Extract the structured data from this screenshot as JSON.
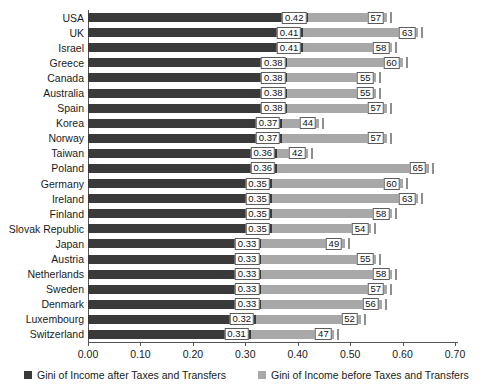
{
  "chart_data": {
    "type": "bar",
    "orientation": "horizontal",
    "stacked_overlay": true,
    "title": "",
    "subtitle": "",
    "xlabel": "",
    "ylabel": "",
    "xlim": [
      0.0,
      0.7
    ],
    "xticks": [
      "0.00",
      "0.10",
      "0.20",
      "0.30",
      "0.40",
      "0.50",
      "0.60",
      "0.70"
    ],
    "xtick_values": [
      0.0,
      0.1,
      0.2,
      0.3,
      0.4,
      0.5,
      0.6,
      0.7
    ],
    "grid": false,
    "legend_position": "bottom",
    "categories": [
      "USA",
      "UK",
      "Israel",
      "Greece",
      "Canada",
      "Australia",
      "Spain",
      "Korea",
      "Norway",
      "Taiwan",
      "Poland",
      "Germany",
      "Ireland",
      "Finland",
      "Slovak Republic",
      "Japan",
      "Austria",
      "Netherlands",
      "Sweden",
      "Denmark",
      "Luxembourg",
      "Switzerland"
    ],
    "series": [
      {
        "name": "Gini of Income after Taxes and Transfers",
        "color": "#3a3a3a",
        "values": [
          0.42,
          0.41,
          0.41,
          0.38,
          0.38,
          0.38,
          0.38,
          0.37,
          0.37,
          0.36,
          0.36,
          0.35,
          0.35,
          0.35,
          0.35,
          0.33,
          0.33,
          0.33,
          0.33,
          0.33,
          0.32,
          0.31
        ],
        "labels": [
          "0.42",
          "0.41",
          "0.41",
          "0.38",
          "0.38",
          "0.38",
          "0.38",
          "0.37",
          "0.37",
          "0.36",
          "0.36",
          "0.35",
          "0.35",
          "0.35",
          "0.35",
          "0.33",
          "0.33",
          "0.33",
          "0.33",
          "0.33",
          "0.32",
          "0.31"
        ]
      },
      {
        "name": "Gini of Income before Taxes and Transfers",
        "color": "#a8a8a8",
        "values": [
          0.57,
          0.63,
          0.58,
          0.6,
          0.55,
          0.55,
          0.57,
          0.44,
          0.57,
          0.42,
          0.65,
          0.6,
          0.63,
          0.58,
          0.54,
          0.49,
          0.55,
          0.58,
          0.57,
          0.56,
          0.52,
          0.47
        ],
        "labels": [
          "57",
          "63",
          "58",
          "60",
          "55",
          "55",
          "57",
          "44",
          "57",
          "42",
          "65",
          "60",
          "63",
          "58",
          "54",
          "49",
          "55",
          "58",
          "57",
          "56",
          "52",
          "47"
        ]
      }
    ],
    "rows": [
      {
        "category": "USA",
        "net": 0.42,
        "net_label": "0.42",
        "gross": 0.57,
        "gross_label": "57"
      },
      {
        "category": "UK",
        "net": 0.41,
        "net_label": "0.41",
        "gross": 0.63,
        "gross_label": "63"
      },
      {
        "category": "Israel",
        "net": 0.41,
        "net_label": "0.41",
        "gross": 0.58,
        "gross_label": "58"
      },
      {
        "category": "Greece",
        "net": 0.38,
        "net_label": "0.38",
        "gross": 0.6,
        "gross_label": "60"
      },
      {
        "category": "Canada",
        "net": 0.38,
        "net_label": "0.38",
        "gross": 0.55,
        "gross_label": "55"
      },
      {
        "category": "Australia",
        "net": 0.38,
        "net_label": "0.38",
        "gross": 0.55,
        "gross_label": "55"
      },
      {
        "category": "Spain",
        "net": 0.38,
        "net_label": "0.38",
        "gross": 0.57,
        "gross_label": "57"
      },
      {
        "category": "Korea",
        "net": 0.37,
        "net_label": "0.37",
        "gross": 0.44,
        "gross_label": "44"
      },
      {
        "category": "Norway",
        "net": 0.37,
        "net_label": "0.37",
        "gross": 0.57,
        "gross_label": "57"
      },
      {
        "category": "Taiwan",
        "net": 0.36,
        "net_label": "0.36",
        "gross": 0.42,
        "gross_label": "42"
      },
      {
        "category": "Poland",
        "net": 0.36,
        "net_label": "0.36",
        "gross": 0.65,
        "gross_label": "65"
      },
      {
        "category": "Germany",
        "net": 0.35,
        "net_label": "0.35",
        "gross": 0.6,
        "gross_label": "60"
      },
      {
        "category": "Ireland",
        "net": 0.35,
        "net_label": "0.35",
        "gross": 0.63,
        "gross_label": "63"
      },
      {
        "category": "Finland",
        "net": 0.35,
        "net_label": "0.35",
        "gross": 0.58,
        "gross_label": "58"
      },
      {
        "category": "Slovak Republic",
        "net": 0.35,
        "net_label": "0.35",
        "gross": 0.54,
        "gross_label": "54"
      },
      {
        "category": "Japan",
        "net": 0.33,
        "net_label": "0.33",
        "gross": 0.49,
        "gross_label": "49"
      },
      {
        "category": "Austria",
        "net": 0.33,
        "net_label": "0.33",
        "gross": 0.55,
        "gross_label": "55"
      },
      {
        "category": "Netherlands",
        "net": 0.33,
        "net_label": "0.33",
        "gross": 0.58,
        "gross_label": "58"
      },
      {
        "category": "Sweden",
        "net": 0.33,
        "net_label": "0.33",
        "gross": 0.57,
        "gross_label": "57"
      },
      {
        "category": "Denmark",
        "net": 0.33,
        "net_label": "0.33",
        "gross": 0.56,
        "gross_label": "56"
      },
      {
        "category": "Luxembourg",
        "net": 0.32,
        "net_label": "0.32",
        "gross": 0.52,
        "gross_label": "52"
      },
      {
        "category": "Switzerland",
        "net": 0.31,
        "net_label": "0.31",
        "gross": 0.47,
        "gross_label": "47"
      }
    ]
  },
  "legend": {
    "items": [
      {
        "label": "Gini of Income after Taxes and Transfers",
        "color": "#3a3a3a"
      },
      {
        "label": "Gini of Income before Taxes and Transfers",
        "color": "#a8a8a8"
      }
    ]
  },
  "colors": {
    "net_bar": "#3a3a3a",
    "gross_bar": "#a8a8a8",
    "axis": "#555555",
    "label_box_border": "#5c5c5c",
    "background": "#ffffff"
  }
}
